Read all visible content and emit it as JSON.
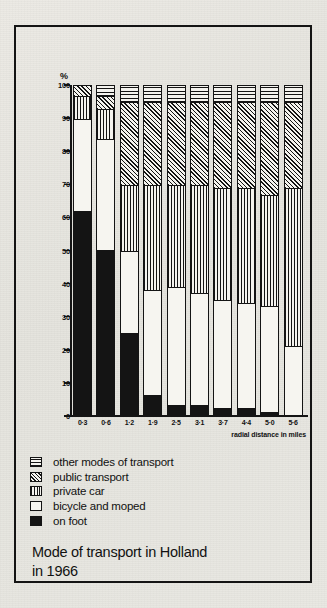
{
  "chart_data": {
    "type": "bar",
    "subtype": "stacked-percentage-column",
    "title": "Mode of transport in Holland in 1966",
    "xlabel": "radial distance in miles",
    "ylabel": "%",
    "ylim": [
      0,
      100
    ],
    "yticks": [
      0,
      10,
      20,
      30,
      40,
      50,
      60,
      70,
      80,
      90,
      100
    ],
    "grid": false,
    "legend_position": "below-plot",
    "categories": [
      "0·3",
      "0·6",
      "1·2",
      "1·9",
      "2·5",
      "3·1",
      "3·7",
      "4·4",
      "5·0",
      "5·6"
    ],
    "series": [
      {
        "name": "on foot",
        "key": "foot",
        "pattern": "solid-black",
        "values": [
          62,
          50,
          25,
          6,
          3,
          3,
          2,
          2,
          1,
          0
        ]
      },
      {
        "name": "bicycle and moped",
        "key": "bicycle",
        "pattern": "white",
        "values": [
          28,
          34,
          25,
          32,
          36,
          34,
          33,
          32,
          32,
          21
        ]
      },
      {
        "name": "private car",
        "key": "car",
        "pattern": "vertical-lines",
        "values": [
          7,
          9,
          20,
          32,
          31,
          33,
          34,
          35,
          34,
          48
        ]
      },
      {
        "name": "public transport",
        "key": "public",
        "pattern": "diagonal-hatch",
        "values": [
          3,
          4,
          25,
          25,
          25,
          25,
          26,
          26,
          28,
          26
        ]
      },
      {
        "name": "other modes of transport",
        "key": "other",
        "pattern": "horizontal-lines",
        "values": [
          0,
          3,
          5,
          5,
          5,
          5,
          5,
          5,
          5,
          5
        ]
      }
    ]
  },
  "figure": {
    "y_axis_unit": "%",
    "x_axis_title": "radial distance in miles",
    "caption_line1": "Mode of transport in Holland",
    "caption_line2": "in 1966"
  }
}
